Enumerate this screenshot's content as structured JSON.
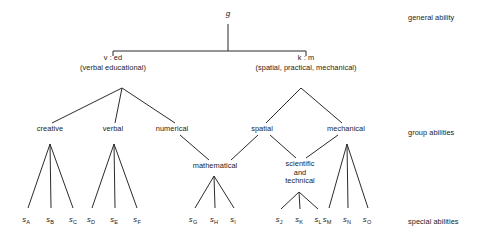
{
  "diagram": {
    "title_root": "g",
    "line_color": "#2b2b2b",
    "text_color": "#1b1b1b",
    "background": "#ffffff"
  },
  "row_labels": [
    {
      "text": "general ability",
      "x": 408,
      "y": 14
    },
    {
      "text": "group abilities",
      "x": 408,
      "y": 129
    },
    {
      "text": "special abilities",
      "x": 408,
      "y": 218
    }
  ],
  "nodes": {
    "root": {
      "label": "g",
      "x": 228,
      "y": 16
    },
    "major": [
      {
        "label": "v : ed",
        "sub": "(verbal educational)",
        "x": 113,
        "y": 58
      },
      {
        "label": "k : m",
        "sub": "(spatial, practical, mechanical)",
        "x": 306,
        "y": 58
      }
    ],
    "group": [
      {
        "label": "creative",
        "x": 50,
        "y": 130
      },
      {
        "label": "verbal",
        "x": 113,
        "y": 130
      },
      {
        "label": "numerical",
        "x": 172,
        "y": 130
      },
      {
        "label": "spatial",
        "x": 262,
        "y": 130
      },
      {
        "label": "mechanical",
        "x": 346,
        "y": 130
      }
    ],
    "minor": [
      {
        "label": "mathematical",
        "x": 215,
        "y": 167
      },
      {
        "label": "scientific and technical",
        "lines": [
          "scientific",
          "and",
          "technical"
        ],
        "x": 300,
        "y": 165
      }
    ]
  },
  "leaves": [
    {
      "letter": "A",
      "x": 26
    },
    {
      "letter": "B",
      "x": 50
    },
    {
      "letter": "C",
      "x": 73
    },
    {
      "letter": "D",
      "x": 91
    },
    {
      "letter": "E",
      "x": 114
    },
    {
      "letter": "F",
      "x": 137
    },
    {
      "letter": "G",
      "x": 193
    },
    {
      "letter": "H",
      "x": 214
    },
    {
      "letter": "I",
      "x": 233
    },
    {
      "letter": "J",
      "x": 279
    },
    {
      "letter": "K",
      "x": 299
    },
    {
      "letter": "L",
      "x": 318
    },
    {
      "letter": "M",
      "x": 327
    },
    {
      "letter": "N",
      "x": 347
    },
    {
      "letter": "O",
      "x": 367
    }
  ],
  "leaf_prefix": "s",
  "leaf_label_y": 216
}
